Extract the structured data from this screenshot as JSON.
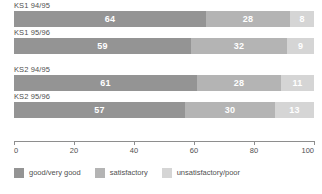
{
  "chart_data": {
    "type": "bar",
    "orientation": "horizontal",
    "stacked": true,
    "stacked_percent": true,
    "title": "",
    "subtitle": "",
    "xlabel": "",
    "ylabel": "",
    "xlim": [
      0,
      100
    ],
    "xticks": [
      0,
      20,
      40,
      60,
      80,
      100
    ],
    "xtick_labels": [
      "0",
      "20",
      "40",
      "60",
      "80",
      "100"
    ],
    "grid": false,
    "legend_position": "bottom-left",
    "categories": [
      "KS1 94/95",
      "KS1 95/96",
      "KS2 94/95",
      "KS2 95/96"
    ],
    "group_breaks_after": [
      "KS1 95/96"
    ],
    "series": [
      {
        "name": "good/very good",
        "color": "#949494",
        "values": [
          64,
          59,
          61,
          57
        ]
      },
      {
        "name": "satisfactory",
        "color": "#b4b4b4",
        "values": [
          28,
          32,
          28,
          30
        ]
      },
      {
        "name": "unsatisfactory/poor",
        "color": "#d5d5d5",
        "values": [
          8,
          9,
          11,
          13
        ]
      }
    ]
  },
  "rows": [
    {
      "label": "KS1 94/95",
      "gap_before": false,
      "segments": [
        {
          "value": "64",
          "pct": 64,
          "class": "s1"
        },
        {
          "value": "28",
          "pct": 28,
          "class": "s2"
        },
        {
          "value": "8",
          "pct": 8,
          "class": "s3"
        }
      ]
    },
    {
      "label": "KS1 95/96",
      "gap_before": false,
      "segments": [
        {
          "value": "59",
          "pct": 59,
          "class": "s1"
        },
        {
          "value": "32",
          "pct": 32,
          "class": "s2"
        },
        {
          "value": "9",
          "pct": 9,
          "class": "s3"
        }
      ]
    },
    {
      "label": "KS2 94/95",
      "gap_before": true,
      "segments": [
        {
          "value": "61",
          "pct": 61,
          "class": "s1"
        },
        {
          "value": "28",
          "pct": 28,
          "class": "s2"
        },
        {
          "value": "11",
          "pct": 11,
          "class": "s3"
        }
      ]
    },
    {
      "label": "KS2 95/96",
      "gap_before": false,
      "segments": [
        {
          "value": "57",
          "pct": 57,
          "class": "s1"
        },
        {
          "value": "30",
          "pct": 30,
          "class": "s2"
        },
        {
          "value": "13",
          "pct": 13,
          "class": "s3"
        }
      ]
    }
  ],
  "axis": {
    "ticks": [
      {
        "label": "0",
        "pct": 0
      },
      {
        "label": "20",
        "pct": 20
      },
      {
        "label": "40",
        "pct": 40
      },
      {
        "label": "60",
        "pct": 60
      },
      {
        "label": "80",
        "pct": 80
      },
      {
        "label": "100",
        "pct": 100
      }
    ]
  },
  "legend": {
    "items": [
      {
        "label": "good/very good",
        "class": "s1"
      },
      {
        "label": "satisfactory",
        "class": "s2"
      },
      {
        "label": "unsatisfactory/poor",
        "class": "s3"
      }
    ]
  }
}
